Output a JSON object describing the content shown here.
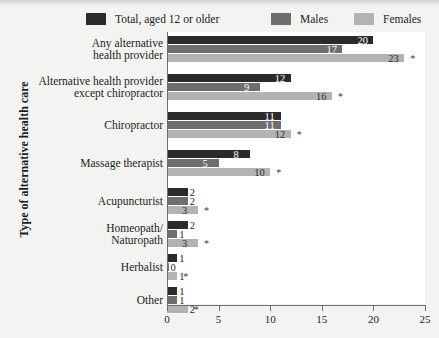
{
  "chart_data": {
    "type": "bar",
    "orientation": "horizontal",
    "title": "",
    "xlabel": "",
    "ylabel": "Type of alternative health care",
    "xlim": [
      0,
      25
    ],
    "xticks": [
      0,
      5,
      10,
      15,
      20,
      25
    ],
    "grid": false,
    "legend_position": "top",
    "categories": [
      "Any alternative\nhealth provider",
      "Alternative health provider\nexcept chiropractor",
      "Chiropractor",
      "Massage therapist",
      "Acupuncturist",
      "Homeopath/\nNaturopath",
      "Herbalist",
      "Other"
    ],
    "series": [
      {
        "name": "Total, aged 12 or older",
        "color": "#2b2b2b",
        "values": [
          20,
          12,
          11,
          8,
          2,
          2,
          1,
          1
        ],
        "significance": [
          "",
          "",
          "",
          "",
          "",
          "",
          "",
          ""
        ]
      },
      {
        "name": "Males",
        "color": "#6e6e6e",
        "values": [
          17,
          9,
          11,
          5,
          2,
          1,
          0,
          1
        ],
        "significance": [
          "",
          "",
          "",
          "",
          "",
          "",
          "",
          ""
        ]
      },
      {
        "name": "Females",
        "color": "#b3b3b3",
        "values": [
          23,
          16,
          12,
          10,
          3,
          3,
          1,
          2
        ],
        "significance": [
          "*",
          "*",
          "*",
          "*",
          "*",
          "*",
          "*",
          "*"
        ]
      }
    ]
  },
  "legend": {
    "items": [
      {
        "label": "Total, aged 12 or older",
        "color": "#2b2b2b"
      },
      {
        "label": "Males",
        "color": "#6e6e6e"
      },
      {
        "label": "Females",
        "color": "#b3b3b3"
      }
    ]
  },
  "axes": {
    "y_title": "Type of alternative health care",
    "x_tick_labels": [
      "0",
      "5",
      "10",
      "15",
      "20",
      "25"
    ]
  },
  "category_lines": [
    [
      "Any alternative",
      "health provider"
    ],
    [
      "Alternative health provider",
      "except chiropractor"
    ],
    [
      "Chiropractor"
    ],
    [
      "Massage therapist"
    ],
    [
      "Acupuncturist"
    ],
    [
      "Homeopath/",
      "Naturopath"
    ],
    [
      "Herbalist"
    ],
    [
      "Other"
    ]
  ],
  "value_labels": {
    "group_0": [
      "20",
      "17",
      "23"
    ],
    "group_1": [
      "12",
      "9",
      "16"
    ],
    "group_2": [
      "11",
      "11",
      "12"
    ],
    "group_3": [
      "8",
      "5",
      "10"
    ],
    "group_4": [
      "2",
      "2",
      "3"
    ],
    "group_5": [
      "2",
      "1",
      "3"
    ],
    "group_6": [
      "1",
      "0",
      "1"
    ],
    "group_7": [
      "1",
      "1",
      "2"
    ]
  },
  "footnote_marker": "*"
}
